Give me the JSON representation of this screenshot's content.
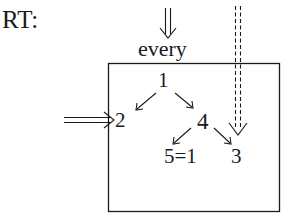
{
  "title": "RT:",
  "entry_label": "every",
  "nodes": {
    "n1": "1",
    "n2": "2",
    "n4": "4",
    "n5": "5=1",
    "n3": "3"
  },
  "edges": [
    {
      "from": "1",
      "to": "2",
      "style": "single-arrow"
    },
    {
      "from": "1",
      "to": "4",
      "style": "single-arrow"
    },
    {
      "from": "4",
      "to": "5=1",
      "style": "single-arrow"
    },
    {
      "from": "4",
      "to": "3",
      "style": "single-arrow"
    },
    {
      "from": "outside-top",
      "to": "every",
      "style": "double-arrow"
    },
    {
      "from": "outside-left",
      "to": "2",
      "style": "double-arrow"
    },
    {
      "from": "outside-top",
      "to": "3",
      "style": "dashed-double-arrow"
    }
  ],
  "colors": {
    "ink": "#1a1a1a",
    "background": "#ffffff"
  }
}
